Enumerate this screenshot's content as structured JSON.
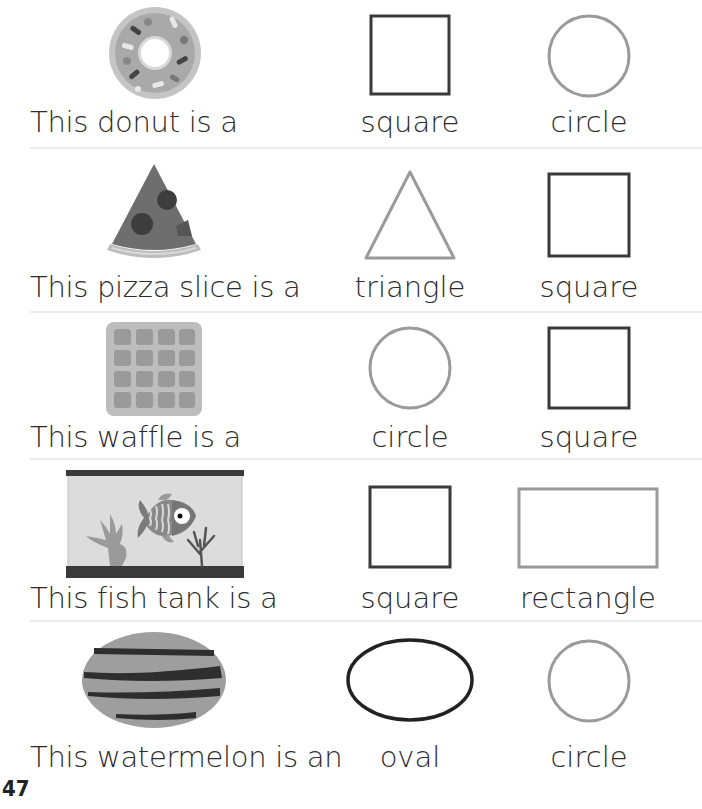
{
  "worksheet": {
    "page_number": "47",
    "rows": [
      {
        "item": "donut",
        "prompt": "This donut is a",
        "options": [
          {
            "label": "square",
            "shape": "square"
          },
          {
            "label": "circle",
            "shape": "circle"
          }
        ]
      },
      {
        "item": "pizza-slice",
        "prompt": "This pizza slice is a",
        "options": [
          {
            "label": "triangle",
            "shape": "triangle"
          },
          {
            "label": "square",
            "shape": "square"
          }
        ]
      },
      {
        "item": "waffle",
        "prompt": "This waffle is a",
        "options": [
          {
            "label": "circle",
            "shape": "circle"
          },
          {
            "label": "square",
            "shape": "square"
          }
        ]
      },
      {
        "item": "fish-tank",
        "prompt": "This fish tank is a",
        "options": [
          {
            "label": "square",
            "shape": "square"
          },
          {
            "label": "rectangle",
            "shape": "rectangle"
          }
        ]
      },
      {
        "item": "watermelon",
        "prompt": "This watermelon is an",
        "options": [
          {
            "label": "oval",
            "shape": "oval"
          },
          {
            "label": "circle",
            "shape": "circle"
          }
        ]
      }
    ]
  },
  "colors": {
    "dark_stroke": "#3a3a3a",
    "light_stroke": "#9a9a9a",
    "separator": "#ececec"
  }
}
